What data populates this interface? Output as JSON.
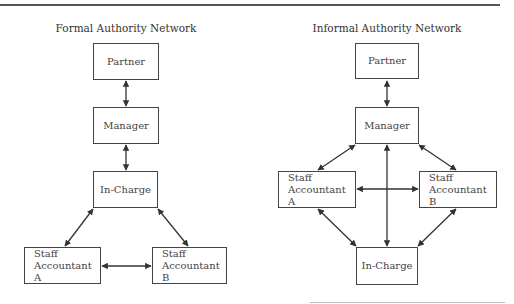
{
  "formal": {
    "title": "Formal Authority Network",
    "nodes": {
      "partner": "Partner",
      "manager": "Manager",
      "in_charge": "In-Charge",
      "staff_a_line1": "Staff",
      "staff_a_line2": "Accountant A",
      "staff_b_line1": "Staff",
      "staff_b_line2": "Accountant B"
    }
  },
  "informal": {
    "title": "Informal Authority Network",
    "nodes": {
      "partner": "Partner",
      "manager": "Manager",
      "in_charge": "In-Charge",
      "staff_a_line1": "Staff",
      "staff_a_line2": "Accountant A",
      "staff_b_line1": "Staff",
      "staff_b_line2": "Accountant B"
    }
  },
  "colors": {
    "line": "#333333",
    "box_border": "#444444"
  }
}
